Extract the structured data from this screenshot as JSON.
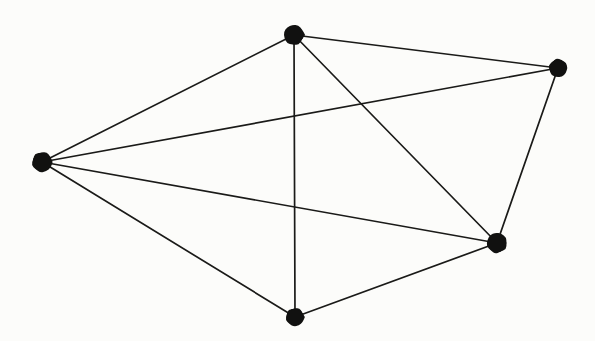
{
  "figure": {
    "kind": "undirected-graph-drawing",
    "background_color": "#fcfcfa",
    "ink_color": "#141412",
    "width": 595,
    "height": 341,
    "vertex_count": 5,
    "edge_count": 9,
    "caption": ""
  },
  "graph": {
    "vertices": [
      {
        "id": "v-left",
        "name": "left-vertex",
        "x": 42,
        "y": 162,
        "r": 10.5,
        "degree": 4
      },
      {
        "id": "v-top",
        "name": "top-vertex",
        "x": 294,
        "y": 35,
        "r": 10.5,
        "degree": 4
      },
      {
        "id": "v-top-right",
        "name": "top-right-vertex",
        "x": 558,
        "y": 68,
        "r": 9.5,
        "degree": 3
      },
      {
        "id": "v-right-lower",
        "name": "right-lower-vertex",
        "x": 497,
        "y": 243,
        "r": 10.5,
        "degree": 4
      },
      {
        "id": "v-bottom",
        "name": "bottom-vertex",
        "x": 295,
        "y": 317,
        "r": 9.5,
        "degree": 3
      }
    ],
    "edges": [
      {
        "id": "e-left-top",
        "from": "v-left",
        "to": "v-top",
        "name": "edge-left-top"
      },
      {
        "id": "e-left-top-right",
        "from": "v-left",
        "to": "v-top-right",
        "name": "edge-left-top-right"
      },
      {
        "id": "e-left-right-lower",
        "from": "v-left",
        "to": "v-right-lower",
        "name": "edge-left-right-lower"
      },
      {
        "id": "e-left-bottom",
        "from": "v-left",
        "to": "v-bottom",
        "name": "edge-left-bottom"
      },
      {
        "id": "e-top-top-right",
        "from": "v-top",
        "to": "v-top-right",
        "name": "edge-top-top-right"
      },
      {
        "id": "e-top-bottom",
        "from": "v-top",
        "to": "v-bottom",
        "name": "edge-top-bottom"
      },
      {
        "id": "e-top-right-lower",
        "from": "v-top",
        "to": "v-right-lower",
        "name": "edge-top-right-lower"
      },
      {
        "id": "e-top-right-right-lower",
        "from": "v-top-right",
        "to": "v-right-lower",
        "name": "edge-top-right-right-lower"
      },
      {
        "id": "e-bottom-right-lower",
        "from": "v-bottom",
        "to": "v-right-lower",
        "name": "edge-bottom-right-lower"
      }
    ]
  }
}
